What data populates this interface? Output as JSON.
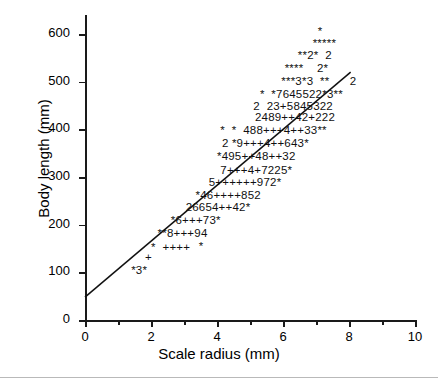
{
  "chart_data": {
    "type": "scatter",
    "title": "",
    "xlabel": "Scale radius (mm)",
    "ylabel": "Body length (mm)",
    "xlim": [
      0,
      10
    ],
    "ylim": [
      0,
      640
    ],
    "grid": false,
    "legend": null,
    "xticks": [
      0,
      2,
      4,
      6,
      8,
      10
    ],
    "xtick_labels": [
      "0",
      "2",
      "4",
      "6",
      "8",
      "10"
    ],
    "xminor_ticks": [
      1,
      3,
      5,
      7,
      9
    ],
    "yticks": [
      0,
      100,
      200,
      300,
      400,
      500,
      600
    ],
    "ytick_labels": [
      "0",
      "100",
      "200",
      "300",
      "400",
      "500",
      "600"
    ],
    "marker_style": "overprinted-text-counts",
    "fit_line": {
      "type": "linear",
      "x0": 0.0,
      "y0": 48,
      "x1": 8.05,
      "y1": 520
    },
    "rows": [
      {
        "y": 605,
        "x_start": 7.05,
        "text": "*"
      },
      {
        "y": 580,
        "x_start": 6.9,
        "text": "*****"
      },
      {
        "y": 553,
        "x_start": 6.45,
        "text": "**2*  2"
      },
      {
        "y": 527,
        "x_start": 6.05,
        "text": "****    2*"
      },
      {
        "y": 500,
        "x_start": 5.95,
        "text": "***3*3  **      2"
      },
      {
        "y": 473,
        "x_start": 5.3,
        "text": "*  *7645522*3**"
      },
      {
        "y": 447,
        "x_start": 5.1,
        "text": "2  23+5845322"
      },
      {
        "y": 424,
        "x_start": 5.15,
        "text": "2489++42+222"
      },
      {
        "y": 397,
        "x_start": 4.1,
        "text": "*  *  488+++4++33**"
      },
      {
        "y": 370,
        "x_start": 4.15,
        "text": "2 *9+++4++643*"
      },
      {
        "y": 341,
        "x_start": 4.0,
        "text": "*495++48++32"
      },
      {
        "y": 313,
        "x_start": 4.1,
        "text": "7+++4+7225*"
      },
      {
        "y": 287,
        "x_start": 3.75,
        "text": "5++++++972*"
      },
      {
        "y": 261,
        "x_start": 3.35,
        "text": "*46++++852"
      },
      {
        "y": 234,
        "x_start": 3.05,
        "text": "26654++42*"
      },
      {
        "y": 207,
        "x_start": 2.6,
        "text": "*6+++73*"
      },
      {
        "y": 181,
        "x_start": 2.2,
        "text": "**8+++94"
      },
      {
        "y": 152,
        "x_start": 2.0,
        "text": "*  ++++"
      },
      {
        "y": 153,
        "x_start": 3.45,
        "text": "*"
      },
      {
        "y": 131,
        "x_start": 1.82,
        "text": "+"
      },
      {
        "y": 103,
        "x_start": 1.4,
        "text": "*3*"
      }
    ]
  }
}
